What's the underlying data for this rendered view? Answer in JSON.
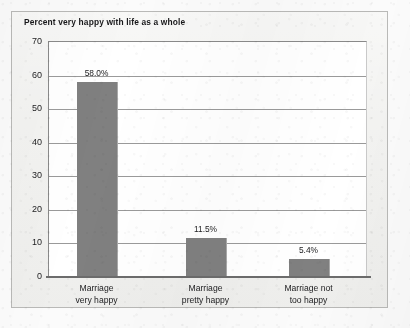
{
  "figure": {
    "title": "Percent very happy with life as a whole",
    "bar_color": "#808080",
    "plot_background": "#ffffff",
    "frame_background": "#f2f2f0"
  },
  "chart_data": {
    "type": "bar",
    "title": "Percent very happy with life as a whole",
    "xlabel": "",
    "ylabel": "",
    "ylim": [
      0,
      70
    ],
    "yticks": [
      0,
      10,
      20,
      30,
      40,
      50,
      60,
      70
    ],
    "ytick_labels": [
      "0",
      "10",
      "20",
      "30",
      "40",
      "50",
      "60",
      "70"
    ],
    "grid": true,
    "grid_axis": "y",
    "legend": false,
    "categories": [
      "Marriage\nvery happy",
      "Marriage\npretty happy",
      "Marriage not\ntoo happy"
    ],
    "category_lines": [
      [
        "Marriage",
        "very happy"
      ],
      [
        "Marriage",
        "pretty happy"
      ],
      [
        "Marriage not",
        "too happy"
      ]
    ],
    "values": [
      58.0,
      11.5,
      5.4
    ],
    "data_labels": [
      "58.0%",
      "11.5%",
      "5.4%"
    ]
  }
}
